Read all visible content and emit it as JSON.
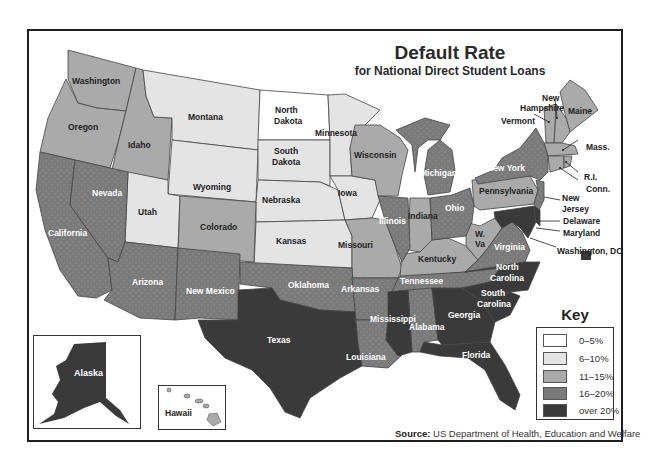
{
  "title": "Default Rate",
  "subtitle": "for National Direct Student Loans",
  "key": {
    "title": "Key",
    "items": [
      {
        "label": "0–5%",
        "color": "#ffffff"
      },
      {
        "label": "6–10%",
        "color": "#e4e4e4"
      },
      {
        "label": "11–15%",
        "color": "#aaaaaa"
      },
      {
        "label": "16–20%",
        "color": "#7a7a7a"
      },
      {
        "label": "over 20%",
        "color": "#3a3a3a"
      }
    ]
  },
  "source": {
    "label": "Source:",
    "text": "US Department of Health, Education and Welfare"
  },
  "insets": {
    "alaska": {
      "label": "Alaska",
      "category": "over 20%"
    },
    "hawaii": {
      "label": "Hawaii",
      "category": "11–15%"
    }
  },
  "states": {
    "Washington": "11–15%",
    "Oregon": "11–15%",
    "Idaho": "11–15%",
    "Montana": "6–10%",
    "Wyoming": "6–10%",
    "North Dakota": "0–5%",
    "South Dakota": "6–10%",
    "Nebraska": "6–10%",
    "Minnesota": "6–10%",
    "Iowa": "6–10%",
    "Kansas": "6–10%",
    "Utah": "6–10%",
    "Colorado": "11–15%",
    "Wisconsin": "11–15%",
    "Missouri": "11–15%",
    "Indiana": "11–15%",
    "Kentucky": "11–15%",
    "W. Va": "11–15%",
    "Pennsylvania": "11–15%",
    "Maine": "11–15%",
    "New Hampshire": "11–15%",
    "Vermont": "11–15%",
    "Mass.": "11–15%",
    "R.I.": "11–15%",
    "Conn.": "11–15%",
    "California": "16–20%",
    "Nevada": "16–20%",
    "Arizona": "16–20%",
    "New Mexico": "16–20%",
    "Oklahoma": "16–20%",
    "Arkansas": "16–20%",
    "Louisiana": "16–20%",
    "Illinois": "16–20%",
    "Michigan": "16–20%",
    "Ohio": "16–20%",
    "New York": "16–20%",
    "New Jersey": "16–20%",
    "Tennessee": "16–20%",
    "Virginia": "16–20%",
    "Alabama": "16–20%",
    "Texas": "over 20%",
    "Mississippi": "over 20%",
    "Georgia": "over 20%",
    "Florida": "over 20%",
    "North Carolina": "over 20%",
    "South Carolina": "over 20%",
    "Delaware": "over 20%",
    "Maryland": "over 20%",
    "Washington, DC": "over 20%",
    "Alaska": "over 20%",
    "Hawaii": "11–15%"
  },
  "labels": {
    "washington": "Washington",
    "oregon": "Oregon",
    "idaho": "Idaho",
    "montana": "Montana",
    "wyoming": "Wyoming",
    "north_dakota_1": "North",
    "north_dakota_2": "Dakota",
    "south_dakota_1": "South",
    "south_dakota_2": "Dakota",
    "nebraska": "Nebraska",
    "minnesota": "Minnesota",
    "iowa": "Iowa",
    "kansas": "Kansas",
    "utah": "Utah",
    "colorado": "Colorado",
    "wisconsin": "Wisconsin",
    "missouri": "Missouri",
    "indiana": "Indiana",
    "kentucky": "Kentucky",
    "wva_1": "W.",
    "wva_2": "Va",
    "pennsylvania": "Pennsylvania",
    "maine": "Maine",
    "new_hampshire_1": "New",
    "new_hampshire_2": "Hampshire",
    "vermont": "Vermont",
    "mass": "Mass.",
    "ri": "R.I.",
    "conn": "Conn.",
    "new_jersey_1": "New",
    "new_jersey_2": "Jersey",
    "delaware": "Delaware",
    "maryland": "Maryland",
    "dc": "Washington, DC",
    "california": "California",
    "nevada": "Nevada",
    "arizona": "Arizona",
    "new_mexico": "New Mexico",
    "oklahoma": "Oklahoma",
    "arkansas": "Arkansas",
    "louisiana": "Louisiana",
    "illinois": "Illinois",
    "michigan": "Michigan",
    "ohio": "Ohio",
    "new_york": "New York",
    "tennessee": "Tennessee",
    "virginia": "Virginia",
    "alabama": "Alabama",
    "texas": "Texas",
    "mississippi": "Mississippi",
    "georgia": "Georgia",
    "florida": "Florida",
    "north_carolina_1": "North",
    "north_carolina_2": "Carolina",
    "south_carolina_1": "South",
    "south_carolina_2": "Carolina"
  }
}
